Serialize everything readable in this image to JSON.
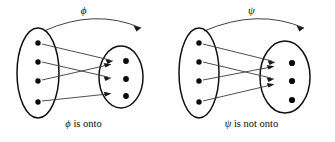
{
  "figure": {
    "background_color": "#ffffff",
    "ink_color": "#0a0a0a",
    "arrow_color": "#3a3a3a"
  },
  "panels": [
    {
      "id": "onto",
      "function_symbol": "ϕ",
      "caption_symbol": "ϕ",
      "caption_text": "is onto",
      "caption_full": "ϕ is onto",
      "domain": {
        "label": "domain-ellipse",
        "dot_count": 4,
        "dots": [
          "d1",
          "d2",
          "d3",
          "d4"
        ]
      },
      "codomain": {
        "label": "codomain-ellipse",
        "dot_count": 3,
        "dots": [
          "c1",
          "c2",
          "c3"
        ],
        "unmapped_dots": []
      },
      "mappings": [
        {
          "from": 1,
          "to": 1
        },
        {
          "from": 2,
          "to": 2
        },
        {
          "from": 3,
          "to": 1
        },
        {
          "from": 4,
          "to": 3
        }
      ],
      "is_onto": true
    },
    {
      "id": "not-onto",
      "function_symbol": "ψ",
      "caption_symbol": "ψ",
      "caption_text": "is not onto",
      "caption_full": "ψ is not onto",
      "domain": {
        "label": "domain-ellipse",
        "dot_count": 4,
        "dots": [
          "d1",
          "d2",
          "d3",
          "d4"
        ]
      },
      "codomain": {
        "label": "codomain-ellipse",
        "dot_count": 3,
        "dots": [
          "c1",
          "c2",
          "c3"
        ],
        "unmapped_dots": [
          "c3"
        ]
      },
      "mappings": [
        {
          "from": 1,
          "to": 1
        },
        {
          "from": 2,
          "to": 2
        },
        {
          "from": 3,
          "to": 1
        },
        {
          "from": 4,
          "to": 2
        }
      ],
      "is_onto": false
    }
  ]
}
